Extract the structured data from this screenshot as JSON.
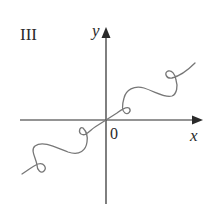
{
  "figure": {
    "panel_label": "III",
    "axes": {
      "x_label": "x",
      "y_label": "y",
      "origin_label": "0"
    },
    "curve": {
      "description": "Wavy looping curve passing through origin, rising from lower-left to upper-right with small loops",
      "color": "#777777"
    },
    "axis_color": "#2a2a2a"
  }
}
